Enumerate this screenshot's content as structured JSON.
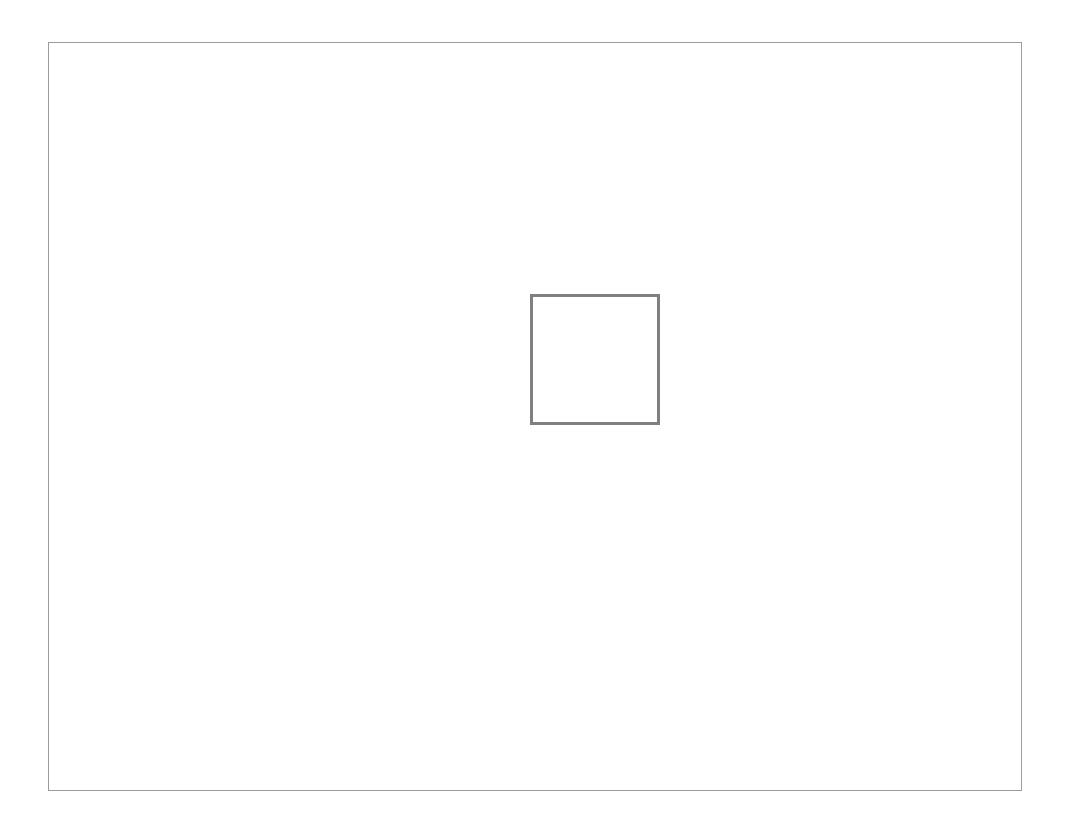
{
  "canvas": {
    "width": 1069,
    "height": 829,
    "background_color": "#ffffff",
    "content_text": ""
  },
  "outer_frame": {
    "label": "",
    "x": 48,
    "y": 42,
    "width": 974,
    "height": 749,
    "border_color": "#9b9b9b",
    "border_width": 1,
    "fill_color": "#ffffff"
  },
  "inner_square": {
    "label": "",
    "x": 529,
    "y": 293,
    "width": 130,
    "height": 131,
    "border_color": "#808080",
    "border_width": 3,
    "fill_color": "#ffffff",
    "content_text": ""
  }
}
